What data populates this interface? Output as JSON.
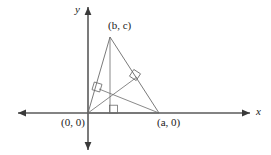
{
  "figure": {
    "name": "coordinate-geometry-triangle-altitudes",
    "background_color": "#ffffff",
    "stroke_color": "#6b6b6b",
    "axis_color": "#5a5a5a",
    "text_color": "#1a1a1a"
  },
  "axes": {
    "x_label": "x",
    "y_label": "y",
    "x_axis": {
      "start_x": 18,
      "end_x": 250,
      "y": 113
    },
    "y_axis": {
      "x": 88,
      "start_y": 7,
      "end_y": 150
    }
  },
  "labels": {
    "vertex_apex": "(b, c)",
    "vertex_origin": "(0, 0)",
    "vertex_a": "(a, 0)"
  },
  "points": {
    "origin": {
      "x": 88,
      "y": 113,
      "label": "(0, 0)"
    },
    "vertex_a": {
      "x": 159,
      "y": 113,
      "label": "(a, 0)"
    },
    "vertex_bc": {
      "x": 110,
      "y": 37,
      "label": "(b, c)"
    },
    "orthocenter": {
      "x": 110,
      "y": 95,
      "label": ""
    },
    "foot_on_ab": {
      "x": 110,
      "y": 113,
      "label": ""
    },
    "foot_on_bc_right": {
      "x": 137,
      "y": 77,
      "label": ""
    },
    "foot_on_ob_left": {
      "x": 99,
      "y": 89,
      "label": ""
    }
  },
  "segments": [
    {
      "name": "side-origin-to-apex",
      "x1": 88,
      "y1": 113,
      "x2": 110,
      "y2": 37
    },
    {
      "name": "side-apex-to-vertex-a",
      "x1": 110,
      "y1": 37,
      "x2": 159,
      "y2": 113
    },
    {
      "name": "side-origin-to-vertex-a",
      "x1": 88,
      "y1": 113,
      "x2": 159,
      "y2": 113
    },
    {
      "name": "altitude-from-apex",
      "x1": 110,
      "y1": 37,
      "x2": 110,
      "y2": 113
    },
    {
      "name": "altitude-from-origin",
      "x1": 88,
      "y1": 113,
      "x2": 137,
      "y2": 77
    },
    {
      "name": "altitude-from-vertex-a",
      "x1": 159,
      "y1": 113,
      "x2": 99,
      "y2": 89
    }
  ],
  "right_angle_markers": [
    {
      "name": "right-angle-marker-left",
      "x": 97,
      "y": 87,
      "rotation": -73
    },
    {
      "name": "right-angle-marker-right",
      "x": 135,
      "y": 75,
      "rotation": -57
    },
    {
      "name": "right-angle-marker-bottom",
      "x": 113,
      "y": 109,
      "rotation": 0
    }
  ]
}
